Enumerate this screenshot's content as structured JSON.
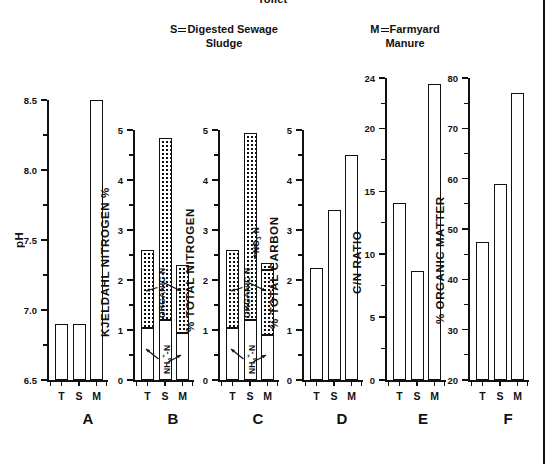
{
  "header": {
    "title_partial": "Toilet",
    "legend_s": {
      "symbol": "S",
      "text_line1": "Digested Sewage",
      "text_line2": "Sludge"
    },
    "legend_m": {
      "symbol": "M",
      "text_line1": "Farmyard",
      "text_line2": "Manure"
    }
  },
  "categories": [
    "T",
    "S",
    "M"
  ],
  "annotations": {
    "organic_n": "ORGANIC N",
    "nh4_n": "NH₄⁺-N",
    "no3_n": "NO₃-N"
  },
  "chart_data": [
    {
      "type": "bar",
      "panel": "A",
      "title": "",
      "ylabel": "pH",
      "xlabel": "",
      "categories": [
        "T",
        "S",
        "M"
      ],
      "values": [
        6.9,
        6.9,
        8.5
      ],
      "ylim": [
        6.5,
        8.5
      ],
      "yticks": [
        6.5,
        7.0,
        7.5,
        8.0,
        8.5
      ],
      "yticklabels": [
        "6.5",
        "7.0",
        "7.5",
        "8.0",
        "8.5"
      ],
      "minor_ticks": [
        6.75,
        7.25,
        7.75,
        8.25
      ],
      "grid": false,
      "legend": "none"
    },
    {
      "type": "bar",
      "panel": "B",
      "title": "",
      "ylabel": "KJELDAHL NITROGEN %",
      "xlabel": "",
      "categories": [
        "T",
        "S",
        "M"
      ],
      "stacked": true,
      "series": [
        {
          "name": "NH₄⁺-N",
          "values": [
            1.05,
            1.2,
            0.95
          ]
        },
        {
          "name": "ORGANIC N",
          "values": [
            1.55,
            3.65,
            1.35
          ]
        }
      ],
      "totals": [
        2.6,
        4.85,
        2.3
      ],
      "ylim": [
        0,
        5
      ],
      "yticks": [
        0,
        1,
        2,
        3,
        4,
        5
      ],
      "yticklabels": [
        "0",
        "1",
        "2",
        "3",
        "4",
        "5"
      ],
      "minor_ticks": [
        0.5,
        1.5,
        2.5,
        3.5,
        4.5
      ],
      "grid": false,
      "legend": "inline-annotations"
    },
    {
      "type": "bar",
      "panel": "C",
      "title": "",
      "ylabel": "% TOTAL NITROGEN",
      "xlabel": "",
      "categories": [
        "T",
        "S",
        "M"
      ],
      "stacked": true,
      "series": [
        {
          "name": "NH₄⁺-N",
          "values": [
            1.05,
            1.2,
            0.9
          ]
        },
        {
          "name": "ORGANIC N",
          "values": [
            1.55,
            3.75,
            1.3
          ]
        },
        {
          "name": "NO₃-N",
          "values": [
            0.0,
            0.0,
            0.15
          ]
        }
      ],
      "totals": [
        2.6,
        4.95,
        2.35
      ],
      "ylim": [
        0,
        5
      ],
      "yticks": [
        0,
        1,
        2,
        3,
        4,
        5
      ],
      "yticklabels": [
        "0",
        "1",
        "2",
        "3",
        "4",
        "5"
      ],
      "minor_ticks": [
        0.5,
        1.5,
        2.5,
        3.5,
        4.5
      ],
      "grid": false,
      "legend": "inline-annotations"
    },
    {
      "type": "bar",
      "panel": "D",
      "title": "",
      "ylabel": "% TOTAL CARBON",
      "xlabel": "",
      "categories": [
        "T",
        "S",
        "M"
      ],
      "values": [
        2.25,
        3.4,
        4.5
      ],
      "ylim": [
        0,
        5
      ],
      "yticks": [
        0,
        1,
        2,
        3,
        4,
        5
      ],
      "yticklabels": [
        "0",
        "1",
        "2",
        "3",
        "4",
        "5"
      ],
      "minor_ticks": [
        0.5,
        1.5,
        2.5,
        3.5,
        4.5
      ],
      "grid": false,
      "legend": "none"
    },
    {
      "type": "bar",
      "panel": "E",
      "title": "",
      "ylabel": "C/N RATIO",
      "xlabel": "",
      "categories": [
        "T",
        "S",
        "M"
      ],
      "values": [
        14.1,
        8.7,
        23.5
      ],
      "ylim": [
        0,
        24
      ],
      "yticks": [
        0,
        5,
        10,
        15,
        20,
        24
      ],
      "yticklabels": [
        "0",
        "5",
        "10",
        "15",
        "20",
        "24"
      ],
      "minor_ticks": [
        2.5,
        7.5,
        12.5,
        17.5,
        22
      ],
      "grid": false,
      "legend": "none"
    },
    {
      "type": "bar",
      "panel": "F",
      "title": "",
      "ylabel": "% ORGANIC MATTER",
      "xlabel": "",
      "categories": [
        "T",
        "S",
        "M"
      ],
      "values": [
        47.5,
        59,
        77
      ],
      "ylim": [
        20,
        80
      ],
      "yticks": [
        20,
        30,
        40,
        50,
        60,
        70,
        80
      ],
      "yticklabels": [
        "20",
        "30",
        "40",
        "50",
        "60",
        "70",
        "80"
      ],
      "minor_ticks": [
        25,
        35,
        45,
        55,
        65,
        75
      ],
      "grid": false,
      "legend": "none"
    }
  ],
  "panel_letters": [
    "A",
    "B",
    "C",
    "D",
    "E",
    "F"
  ]
}
